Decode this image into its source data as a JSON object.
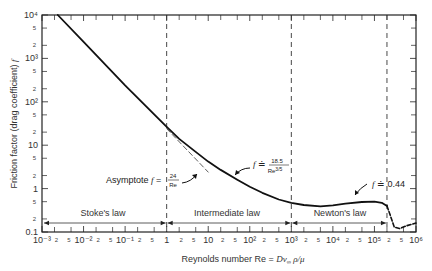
{
  "chart_data": {
    "type": "line",
    "title": "",
    "xlabel": "Reynolds number Re = Dv∞ρ/μ",
    "ylabel": "Friction factor (drag coefficient) f",
    "xscale": "log",
    "yscale": "log",
    "xlim": [
      0.001,
      1000000
    ],
    "ylim": [
      0.1,
      10000
    ],
    "grid": false,
    "x_major_ticks": [
      "10⁻³",
      "10⁻²",
      "10⁻¹",
      "1",
      "10",
      "10²",
      "10³",
      "10⁴",
      "10⁵",
      "10⁶"
    ],
    "x_minor_tick_labels": [
      "2",
      "5"
    ],
    "y_major_ticks": [
      "0.1",
      "1",
      "10",
      "10²",
      "10³",
      "10⁴"
    ],
    "y_minor_tick_labels": [
      "2",
      "5"
    ],
    "series": [
      {
        "name": "Friction factor f (sphere)",
        "style": "solid",
        "x": [
          0.0024,
          0.01,
          0.1,
          1,
          2,
          5,
          10,
          20,
          50,
          100,
          200,
          500,
          1000,
          2000,
          5000,
          10000,
          20000,
          50000,
          100000,
          150000,
          200000
        ],
        "y": [
          10000,
          2400,
          240,
          26.5,
          14,
          7,
          4.2,
          2.7,
          1.6,
          1.1,
          0.8,
          0.56,
          0.47,
          0.42,
          0.39,
          0.41,
          0.45,
          0.49,
          0.5,
          0.47,
          0.4
        ]
      },
      {
        "name": "Drag crisis (dashed)",
        "style": "dashed",
        "x": [
          200000,
          300000,
          400000,
          600000,
          1000000
        ],
        "y": [
          0.4,
          0.13,
          0.12,
          0.14,
          0.16
        ]
      },
      {
        "name": "Asymptote f = 24/Re",
        "style": "dashed-thin",
        "x": [
          1,
          10
        ],
        "y": [
          24,
          2.4
        ]
      }
    ],
    "vertical_lines": [
      {
        "x": 1,
        "style": "dashed",
        "label": "Stoke's law / Intermediate law boundary"
      },
      {
        "x": 1000,
        "style": "dashed",
        "label": "Intermediate law / Newton's law boundary"
      },
      {
        "x": 200000,
        "style": "dashed",
        "label": "Newton's law upper limit"
      }
    ],
    "regions": [
      {
        "label": "Stoke's law",
        "x_from": 0.001,
        "x_to": 1
      },
      {
        "label": "Intermediate law",
        "x_from": 1,
        "x_to": 1000
      },
      {
        "label": "Newton's law",
        "x_from": 1000,
        "x_to": 200000
      }
    ],
    "annotations": [
      {
        "text": "Asymptote f = 24/Re",
        "points_to": [
          6,
          4
        ]
      },
      {
        "text": "f ≐ 18.5/Re^(3/5)",
        "points_to": [
          30,
          2.2
        ]
      },
      {
        "text": "f ≐ 0.44",
        "points_to": [
          3000,
          0.42
        ]
      }
    ]
  },
  "labels": {
    "xlabel_prefix": "Reynolds number  Re = ",
    "xlabel_formula": "Dv",
    "xlabel_sub": "∞",
    "xlabel_suffix": " ρ/μ",
    "ylabel": "Friction factor (drag coefficient)",
    "ylabel_symbol": "f",
    "region_stokes": "Stoke's law",
    "region_intermediate": "Intermediate law",
    "region_newton": "Newton's law",
    "asymptote_prefix": "Asymptote ",
    "asymptote_f": "f",
    "asymptote_eq": " = ",
    "asymptote_num": "24",
    "asymptote_den": "Re",
    "intermediate_f": "f",
    "intermediate_eq": " ≐ ",
    "intermediate_num": "18.5",
    "intermediate_den": "Re",
    "intermediate_den_exp": "3/5",
    "newton_f": "f",
    "newton_eq": " ≐ 0.44"
  }
}
